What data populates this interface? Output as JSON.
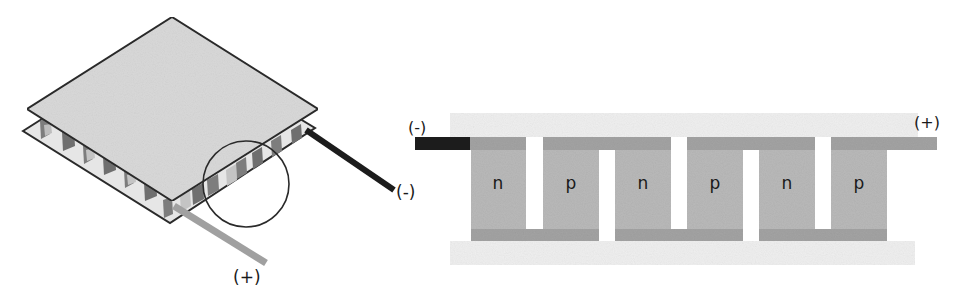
{
  "diagram": {
    "colors": {
      "plate_top": "#d9d9d9",
      "plate_outline": "#2a2a2a",
      "ceramic_plate": "#ececec",
      "connector": "#a3a3a3",
      "semiconductor": "#b9b9b9",
      "negative_lead": "#1c1c1c",
      "positive_lead": "#a0a0a0",
      "pellet_dark": "#7d7d7d",
      "pellet_light": "#bdbdbd"
    },
    "module_3d": {
      "negative_terminal_label": "(-)",
      "positive_terminal_label": "(+)",
      "detail_circle": "magnified region"
    },
    "cross_section": {
      "negative_terminal_label": "(-)",
      "positive_terminal_label": "(+)",
      "blocks": [
        {
          "label": "n",
          "type": "n-type"
        },
        {
          "label": "p",
          "type": "p-type"
        },
        {
          "label": "n",
          "type": "n-type"
        },
        {
          "label": "p",
          "type": "p-type"
        },
        {
          "label": "n",
          "type": "n-type"
        },
        {
          "label": "p",
          "type": "p-type"
        }
      ]
    }
  }
}
